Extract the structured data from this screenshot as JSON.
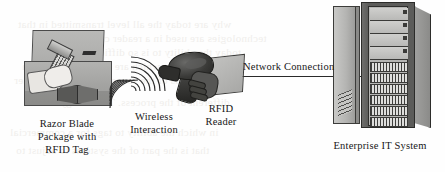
{
  "figure": {
    "kind": "rfid-system-diagram",
    "background_color": "#fefefe",
    "ink_color": "#1a1a1a"
  },
  "labels": {
    "package": {
      "name": "razor-blade-package-label",
      "lines": [
        "Razor Blade",
        "Package with",
        "RFID Tag"
      ]
    },
    "wireless": {
      "name": "wireless-interaction-label",
      "lines": [
        "Wireless",
        "Interaction"
      ]
    },
    "reader": {
      "name": "rfid-reader-label",
      "lines": [
        "RFID",
        "Reader"
      ]
    },
    "network": {
      "name": "network-connection-label",
      "text": "Network Connection"
    },
    "enterprise": {
      "name": "enterprise-it-system-label",
      "text": "Enterprise IT System"
    }
  },
  "nodes": {
    "package": {
      "icon": "cardboard-box-with-razor-icon",
      "description": "open cardboard package containing a hand holding a razor"
    },
    "tag": {
      "icon": "rfid-tag-icon",
      "description": "dark bow-tie shaped RFID tag on package"
    },
    "waves": {
      "icon": "wireless-signal-arcs-icon",
      "left_arc_count": 6,
      "right_arc_count": 7
    },
    "reader": {
      "icon": "handheld-rfid-scanner-icon",
      "description": "dark handheld scanner gun held by a hand in a sleeve"
    },
    "rack": {
      "icon": "server-rack-icon",
      "blank_shelf_count": 4,
      "slotted_module_count": 6
    }
  },
  "ghost_text": {
    "note": "faint reverse-side bleed-through from the scanned page",
    "lines": [
      "why are today the all level transmitted in that",
      "technologies are used in a reader can contain",
      "today the ability to is so difficult the system",
      "could product which are handled by an item",
      "as on items of the sequence numbering other",
      "different of the process. Technology and its",
      "in which the ability to tags for a commercial",
      "that is the part of the systems to adjust to"
    ]
  }
}
